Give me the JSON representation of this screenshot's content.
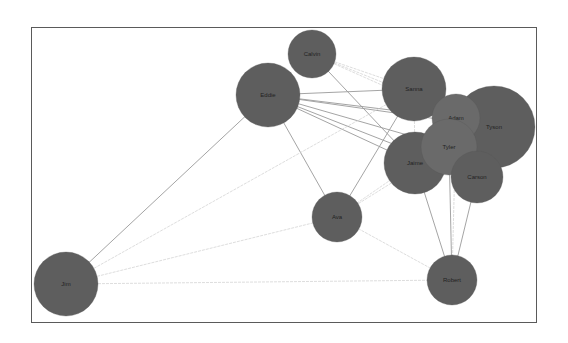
{
  "diagram": {
    "type": "force-directed network graph",
    "frame": {
      "x": 31,
      "y": 27,
      "width": 506,
      "height": 296
    },
    "colors": {
      "node_fill": "#5e5e5e",
      "node_fill_light": "#6a6a6a",
      "edge": "#9a9a9a",
      "edge_light": "#cfcfcf",
      "label": "#222222"
    },
    "nodes": [
      {
        "id": "calvin",
        "label": "Calvin",
        "x": 312,
        "y": 54,
        "r": 24
      },
      {
        "id": "eddie",
        "label": "Eddie",
        "x": 268,
        "y": 95,
        "r": 32
      },
      {
        "id": "sanna",
        "label": "Sanna",
        "x": 414,
        "y": 89,
        "r": 32
      },
      {
        "id": "tyson",
        "label": "Tyson",
        "x": 494,
        "y": 127,
        "r": 41
      },
      {
        "id": "adam",
        "label": "Adam",
        "x": 456,
        "y": 118,
        "r": 24
      },
      {
        "id": "jaime",
        "label": "Jaime",
        "x": 415,
        "y": 163,
        "r": 31
      },
      {
        "id": "tyler",
        "label": "Tyler",
        "x": 449,
        "y": 147,
        "r": 28
      },
      {
        "id": "carson",
        "label": "Carson",
        "x": 477,
        "y": 177,
        "r": 26
      },
      {
        "id": "ava",
        "label": "Ava",
        "x": 337,
        "y": 217,
        "r": 25
      },
      {
        "id": "robert",
        "label": "Robert",
        "x": 452,
        "y": 280,
        "r": 25
      },
      {
        "id": "jim",
        "label": "Jim",
        "x": 66,
        "y": 284,
        "r": 32
      }
    ],
    "edges": [
      {
        "from": "eddie",
        "to": "sanna",
        "style": "dark"
      },
      {
        "from": "eddie",
        "to": "adam",
        "style": "dark"
      },
      {
        "from": "eddie",
        "to": "tyler",
        "style": "dark"
      },
      {
        "from": "eddie",
        "to": "jaime",
        "style": "dark"
      },
      {
        "from": "eddie",
        "to": "tyson",
        "style": "dark"
      },
      {
        "from": "eddie",
        "to": "carson",
        "style": "dark"
      },
      {
        "from": "eddie",
        "to": "ava",
        "style": "dark"
      },
      {
        "from": "calvin",
        "to": "sanna",
        "style": "light"
      },
      {
        "from": "calvin",
        "to": "adam",
        "style": "light"
      },
      {
        "from": "calvin",
        "to": "jaime",
        "style": "dark"
      },
      {
        "from": "calvin",
        "to": "tyson",
        "style": "light"
      },
      {
        "from": "sanna",
        "to": "ava",
        "style": "dark"
      },
      {
        "from": "sanna",
        "to": "jaime",
        "style": "light"
      },
      {
        "from": "jaime",
        "to": "ava",
        "style": "light"
      },
      {
        "from": "tyler",
        "to": "ava",
        "style": "light"
      },
      {
        "from": "jaime",
        "to": "robert",
        "style": "dark"
      },
      {
        "from": "tyler",
        "to": "robert",
        "style": "dark"
      },
      {
        "from": "carson",
        "to": "robert",
        "style": "dark"
      },
      {
        "from": "adam",
        "to": "robert",
        "style": "light"
      },
      {
        "from": "ava",
        "to": "robert",
        "style": "light"
      },
      {
        "from": "jim",
        "to": "eddie",
        "style": "dark"
      },
      {
        "from": "jim",
        "to": "sanna",
        "style": "light"
      },
      {
        "from": "jim",
        "to": "ava",
        "style": "light"
      },
      {
        "from": "jim",
        "to": "robert",
        "style": "light"
      }
    ]
  }
}
